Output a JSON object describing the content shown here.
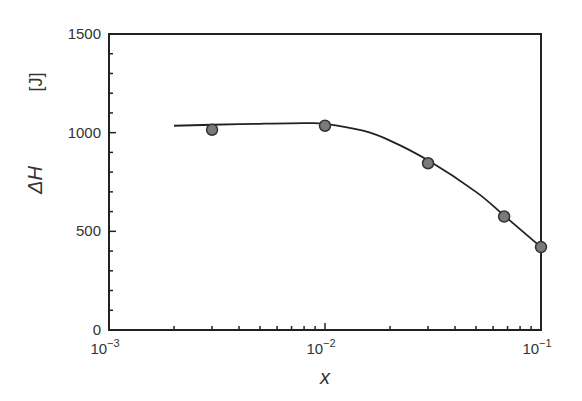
{
  "chart_data": {
    "type": "line",
    "title": "",
    "xlabel": "x",
    "ylabel": "ΔH",
    "yunit": "[J]",
    "xscale": "log",
    "xlim": [
      0.001,
      0.1
    ],
    "ylim": [
      0,
      1500
    ],
    "xticks": [
      {
        "base": "10",
        "exp": "−3"
      },
      {
        "base": "10",
        "exp": "−2"
      },
      {
        "base": "10",
        "exp": "−1"
      }
    ],
    "yticks": [
      "0",
      "500",
      "1000",
      "1500"
    ],
    "grid": false,
    "legend": null,
    "series": [
      {
        "name": "measured",
        "kind": "scatter",
        "marker_color": "#7a7a7a",
        "x": [
          0.003,
          0.01,
          0.03,
          0.0675,
          0.1
        ],
        "y": [
          1015,
          1035,
          845,
          575,
          420
        ]
      },
      {
        "name": "fit",
        "kind": "line",
        "color": "#222222",
        "x": [
          0.002,
          0.003,
          0.005,
          0.008,
          0.01,
          0.015,
          0.02,
          0.03,
          0.05,
          0.0675,
          0.1
        ],
        "y": [
          1035,
          1040,
          1045,
          1048,
          1045,
          1010,
          960,
          860,
          700,
          580,
          420
        ]
      }
    ]
  }
}
